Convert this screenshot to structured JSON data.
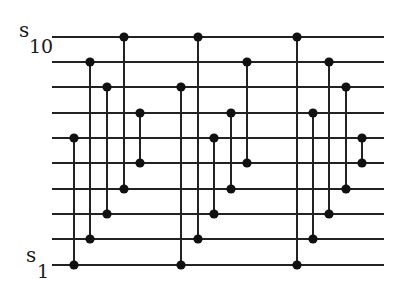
{
  "diagram": {
    "type": "sorting-network",
    "line_color": "#222222",
    "node_color": "#111111",
    "wire_x_start": 52,
    "wire_x_end": 384,
    "wire_y": [
      37,
      62,
      87,
      113,
      138,
      163,
      189,
      214,
      239,
      265
    ],
    "labels": {
      "top": {
        "symbol": "s",
        "subscript": "10"
      },
      "bottom": {
        "symbol": "s",
        "subscript": "1"
      }
    },
    "comparators": [
      {
        "x": 74,
        "from": 4,
        "to": 9
      },
      {
        "x": 90,
        "from": 1,
        "to": 8
      },
      {
        "x": 107,
        "from": 2,
        "to": 7
      },
      {
        "x": 124,
        "from": 0,
        "to": 6
      },
      {
        "x": 140,
        "from": 3,
        "to": 5
      },
      {
        "x": 181,
        "from": 2,
        "to": 9
      },
      {
        "x": 198,
        "from": 0,
        "to": 8
      },
      {
        "x": 214,
        "from": 4,
        "to": 7
      },
      {
        "x": 231,
        "from": 3,
        "to": 6
      },
      {
        "x": 247,
        "from": 1,
        "to": 5
      },
      {
        "x": 297,
        "from": 0,
        "to": 9
      },
      {
        "x": 313,
        "from": 3,
        "to": 8
      },
      {
        "x": 329,
        "from": 1,
        "to": 7
      },
      {
        "x": 346,
        "from": 2,
        "to": 6
      },
      {
        "x": 362,
        "from": 4,
        "to": 5
      }
    ]
  }
}
